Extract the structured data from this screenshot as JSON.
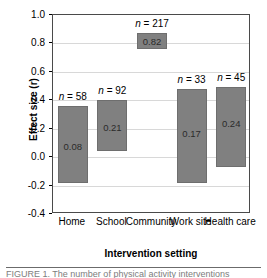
{
  "chart_data": {
    "type": "bar",
    "title": "",
    "xlabel": "Intervention setting",
    "ylabel": "Effect size (r)",
    "ylim": [
      -0.4,
      1.0
    ],
    "yticks": [
      "1.0",
      "0.8",
      "0.6",
      "0.4",
      "0.2",
      "0.0",
      "-0.2",
      "-0.4"
    ],
    "ytick_values": [
      1.0,
      0.8,
      0.6,
      0.4,
      0.2,
      0.0,
      -0.2,
      -0.4
    ],
    "grid": true,
    "legend": "none",
    "categories": [
      "Home",
      "School",
      "Community",
      "Work site",
      "Health care"
    ],
    "values": [
      0.08,
      0.21,
      0.82,
      0.17,
      0.24
    ],
    "value_labels": [
      "0.08",
      "0.21",
      "0.82",
      "0.17",
      "0.24"
    ],
    "n_labels": [
      "n = 58",
      "n = 92",
      "n = 217",
      "n = 33",
      "n = 45"
    ],
    "n_values": [
      58,
      92,
      217,
      33,
      45
    ],
    "interval_low": [
      -0.18,
      0.04,
      0.76,
      -0.18,
      -0.07
    ],
    "interval_high": [
      0.36,
      0.4,
      0.87,
      0.48,
      0.49
    ],
    "bar_color": "#808080",
    "bar_edge_color": "#6e6e6e",
    "grid_color": "#d8d8d8",
    "axis_color": "#4a4a4a"
  },
  "caption": {
    "cut_text": "FIGURE 1.  The number of physical activity interventions"
  }
}
